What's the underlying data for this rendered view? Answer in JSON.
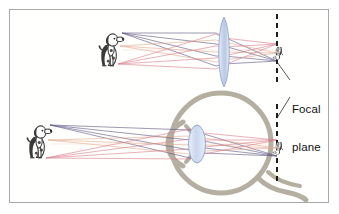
{
  "figure": {
    "border_color": "#a8a8a8",
    "background": "#ffffff"
  },
  "annotations": {
    "focal_plane": {
      "line1": "Focal",
      "line2": "plane"
    }
  },
  "colors": {
    "ray_violet": "#5b5280",
    "ray_pink": "#e88a96",
    "ray_rose": "#d4707f",
    "ray_salmon": "#e8a78f",
    "lens_fill": "#c6d4ec",
    "lens_stroke": "#8fa4c8",
    "eye_stroke": "#b3aea0",
    "dashed_line": "#1a1a1a",
    "object_ink": "#2a2a2a"
  },
  "diagrams": [
    {
      "id": "lens-diagram",
      "name": "camera-lens-ray-diagram",
      "object": "dog",
      "object_position": {
        "x": 112,
        "y": 50
      },
      "optic": "biconvex-lens",
      "optic_position": {
        "x": 224,
        "y": 52
      },
      "image_position": {
        "x": 277,
        "y": 50
      },
      "focal_plane_x": 277,
      "image_orientation": "inverted"
    },
    {
      "id": "eye-diagram",
      "name": "human-eye-ray-diagram",
      "object": "dog",
      "object_position": {
        "x": 40,
        "y": 142
      },
      "optic": "eye-lens",
      "optic_position": {
        "x": 197,
        "y": 145
      },
      "image_position": {
        "x": 277,
        "y": 145
      },
      "focal_plane_x": 277,
      "image_orientation": "inverted"
    }
  ],
  "ray_bundles": {
    "top": [
      {
        "color_key": "ray_violet",
        "from_point": "object-head"
      },
      {
        "color_key": "ray_salmon",
        "from_point": "object-middle"
      },
      {
        "color_key": "ray_rose",
        "from_point": "object-feet"
      }
    ],
    "bottom": [
      {
        "color_key": "ray_violet",
        "from_point": "object-head"
      },
      {
        "color_key": "ray_salmon",
        "from_point": "object-middle"
      },
      {
        "color_key": "ray_rose",
        "from_point": "object-feet"
      }
    ]
  }
}
